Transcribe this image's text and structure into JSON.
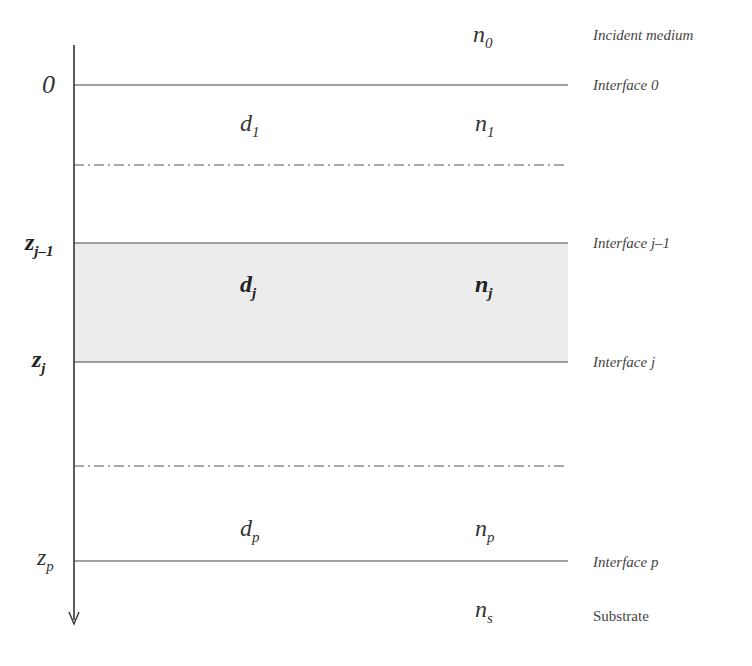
{
  "title_clipped": "",
  "axis": {
    "direction": "downward",
    "labels": {
      "zero": "0",
      "z_jm1": {
        "base": "z",
        "sub": "j–1"
      },
      "z_j": {
        "base": "z",
        "sub": "j"
      },
      "z_p": {
        "base": "z",
        "sub": "p"
      }
    }
  },
  "layers": {
    "incident": {
      "n": {
        "base": "n",
        "sub": "0"
      },
      "label": "Incident medium"
    },
    "layer1": {
      "d": {
        "base": "d",
        "sub": "1"
      },
      "n": {
        "base": "n",
        "sub": "1"
      }
    },
    "layerj": {
      "d": {
        "base": "d",
        "sub": "j"
      },
      "n": {
        "base": "n",
        "sub": "j"
      },
      "fill": "#ececec"
    },
    "layerp": {
      "d": {
        "base": "d",
        "sub": "p"
      },
      "n": {
        "base": "n",
        "sub": "p"
      }
    },
    "substrate": {
      "n": {
        "base": "n",
        "sub": "s"
      },
      "label": "Substrate"
    }
  },
  "interfaces": {
    "i0": "Interface 0",
    "ijm1": "Interface j–1",
    "ij": "Interface j",
    "ip": "Interface p"
  }
}
